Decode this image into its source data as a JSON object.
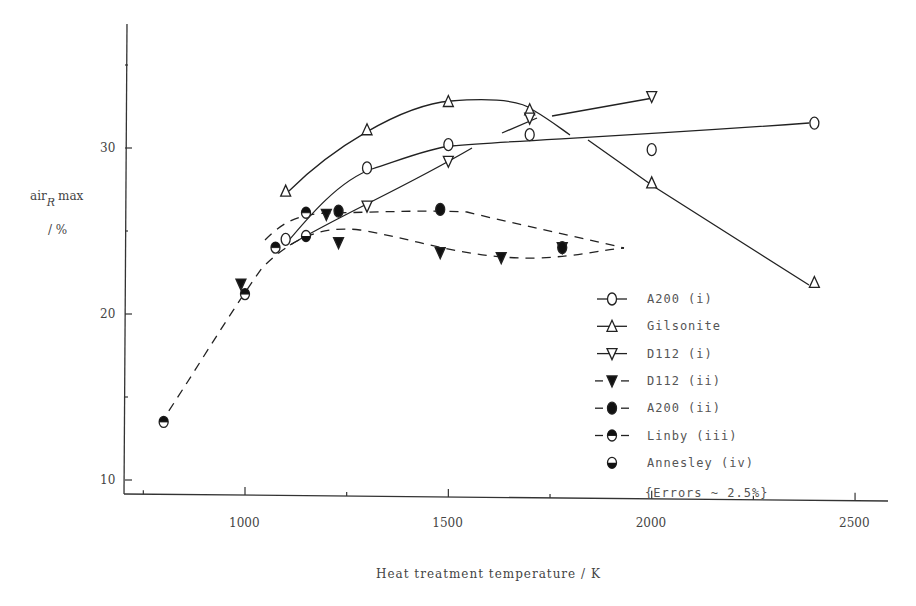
{
  "chart_data": {
    "type": "line",
    "title": "",
    "xlabel": "Heat treatment temperature / K",
    "ylabel": "air_R max / %",
    "ylabel_main": "air",
    "ylabel_sub": "R",
    "ylabel_rest": "max",
    "ylabel_unit": "/ %",
    "xlim": [
      700,
      2600
    ],
    "ylim": [
      7,
      38
    ],
    "x_ticks": [
      1000,
      1500,
      2000,
      2500
    ],
    "x_tick_labels": [
      "1000",
      "1500",
      "2000",
      "2500"
    ],
    "y_ticks": [
      10,
      20,
      30
    ],
    "y_tick_labels": [
      "10",
      "20",
      "30"
    ],
    "grid": false,
    "legend_position": "lower right",
    "annotation": "{Errors ~ 2.5%}",
    "series": [
      {
        "name": "A200 (i)",
        "marker": "open-circle",
        "line": "solid",
        "x": [
          1100,
          1300,
          1500,
          1700,
          2000,
          2400
        ],
        "y": [
          24.5,
          28.8,
          30.2,
          30.8,
          29.9,
          31.5
        ]
      },
      {
        "name": "Gilsonite",
        "marker": "open-triangle-up",
        "line": "solid",
        "x": [
          1100,
          1300,
          1500,
          1700,
          2000,
          2400
        ],
        "y": [
          27.4,
          31.1,
          32.8,
          32.3,
          27.9,
          21.9
        ]
      },
      {
        "name": "D112 (i)",
        "marker": "open-triangle-down",
        "line": "solid",
        "x": [
          1300,
          1500,
          1700,
          2000
        ],
        "y": [
          26.5,
          29.2,
          31.8,
          33.1
        ]
      },
      {
        "name": "D112 (ii)",
        "marker": "filled-triangle-down",
        "line": "dashed",
        "x": [
          990,
          1200,
          1230,
          1480,
          1630,
          1780
        ],
        "y": [
          21.8,
          26.0,
          24.3,
          23.7,
          23.4,
          24.0
        ]
      },
      {
        "name": "A200 (ii)",
        "marker": "filled-circle",
        "line": "dashed",
        "x": [
          1230,
          1480,
          1780
        ],
        "y": [
          26.2,
          26.3,
          24.0
        ]
      },
      {
        "name": "Linby (iii)",
        "marker": "half-filled-circle-top",
        "line": "dashed",
        "x": [
          800,
          1000,
          1075,
          1150
        ],
        "y": [
          13.5,
          21.2,
          24.0,
          26.1
        ]
      },
      {
        "name": "Annesley (iv)",
        "marker": "half-filled-circle-bottom",
        "line": "none",
        "x": [
          1150
        ],
        "y": [
          24.7
        ]
      }
    ]
  }
}
